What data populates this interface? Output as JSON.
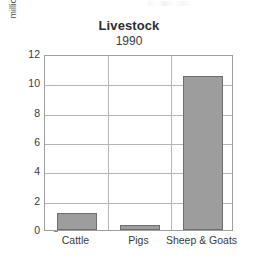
{
  "chart_data": {
    "type": "bar",
    "title": "Livestock",
    "subtitle": "1990",
    "xlabel": "",
    "ylabel": "million head",
    "categories": [
      "Cattle",
      "Pigs",
      "Sheep & Goats"
    ],
    "values": [
      1.15,
      0.35,
      10.5
    ],
    "ylim": [
      0,
      12
    ],
    "ytick_labels": [
      "0",
      "2",
      "4",
      "6",
      "8",
      "10",
      "12"
    ],
    "ytick_values": [
      0,
      2,
      4,
      6,
      8,
      10,
      12
    ],
    "grid": "horizontal-and-vertical-category-separators",
    "legend": "none",
    "bar_fill_color": "#9d9d9d",
    "bar_edge_color": "#6e6e6e",
    "gridline_color": "#b4b4b4",
    "frame_color": "#9e9e9e",
    "background_color": "#ffffff"
  }
}
